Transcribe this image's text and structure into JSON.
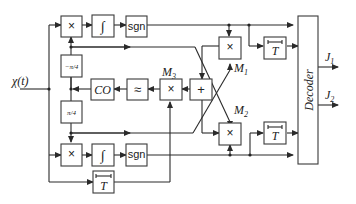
{
  "diagram": {
    "type": "block-diagram",
    "input_label": "χ(t)",
    "blocks": {
      "mult_top": "×",
      "integrator_top": "∫",
      "sgn_top": "sgn",
      "phase_neg": "−π/4",
      "phase_pos": "π/4",
      "co": "CO",
      "lowpass": "≈",
      "mult_m3": "×",
      "adder": "+",
      "mult_m1": "×",
      "mult_m2": "×",
      "mult_bottom": "×",
      "integrator_bottom": "∫",
      "sgn_bottom": "sgn",
      "delay_top": "T",
      "delay_mid": "T",
      "delay_bottom": "T",
      "decoder": "Decoder"
    },
    "labels": {
      "m1": "M",
      "m1_sub": "1",
      "m2": "M",
      "m2_sub": "2",
      "m3": "M",
      "m3_sub": "3"
    },
    "outputs": {
      "j1": "J",
      "j1_sub": "1",
      "j2": "J",
      "j2_sub": "2"
    }
  }
}
